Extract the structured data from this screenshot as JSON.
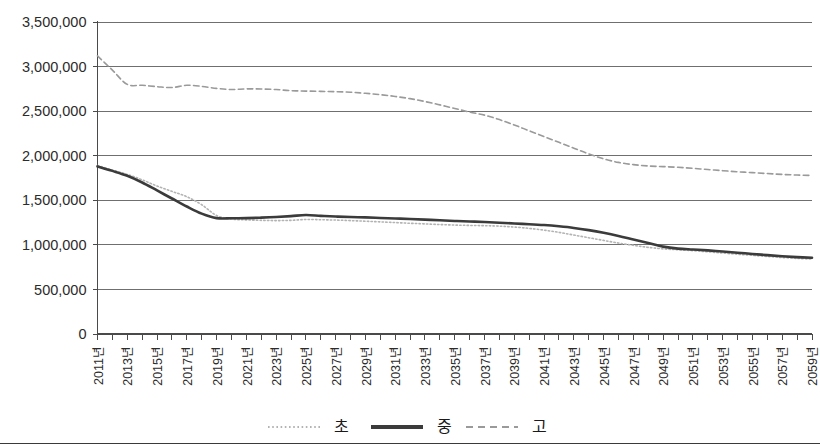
{
  "chart_data": {
    "type": "line",
    "title": "",
    "subtitle": "",
    "xlabel": "",
    "ylabel": "",
    "grid": true,
    "legend_position": "bottom",
    "ylim": [
      0,
      3500000
    ],
    "ytick_labels": [
      "3,500,000",
      "3,000,000",
      "2,500,000",
      "2,000,000",
      "1,500,000",
      "1,000,000",
      "500,000",
      "0"
    ],
    "ytick_values": [
      3500000,
      3000000,
      2500000,
      2000000,
      1500000,
      1000000,
      500000,
      0
    ],
    "xlim": [
      2011,
      2059
    ],
    "x": [
      2011,
      2012,
      2013,
      2014,
      2015,
      2016,
      2017,
      2018,
      2019,
      2020,
      2021,
      2022,
      2023,
      2024,
      2025,
      2026,
      2027,
      2028,
      2029,
      2030,
      2031,
      2032,
      2033,
      2034,
      2035,
      2036,
      2037,
      2038,
      2039,
      2040,
      2041,
      2042,
      2043,
      2044,
      2045,
      2046,
      2047,
      2048,
      2049,
      2050,
      2051,
      2052,
      2053,
      2054,
      2055,
      2056,
      2057,
      2058,
      2059
    ],
    "xtick_labels": [
      "2011년",
      "2013년",
      "2015년",
      "2017년",
      "2019년",
      "2021년",
      "2023년",
      "2025년",
      "2027년",
      "2029년",
      "2031년",
      "2033년",
      "2035년",
      "2037년",
      "2039년",
      "2041년",
      "2043년",
      "2045년",
      "2047년",
      "2049년",
      "2051년",
      "2053년",
      "2055년",
      "2057년",
      "2059년"
    ],
    "xtick_values": [
      2011,
      2013,
      2015,
      2017,
      2019,
      2021,
      2023,
      2025,
      2027,
      2029,
      2031,
      2033,
      2035,
      2037,
      2039,
      2041,
      2043,
      2045,
      2047,
      2049,
      2051,
      2053,
      2055,
      2057,
      2059
    ],
    "series": [
      {
        "name": "초",
        "style": "dotted",
        "color": "#b3b3b3",
        "values": [
          1890000,
          1840000,
          1790000,
          1730000,
          1660000,
          1600000,
          1540000,
          1450000,
          1330000,
          1290000,
          1280000,
          1275000,
          1272000,
          1275000,
          1285000,
          1282000,
          1278000,
          1272000,
          1265000,
          1258000,
          1250000,
          1242000,
          1235000,
          1228000,
          1222000,
          1218000,
          1215000,
          1210000,
          1200000,
          1185000,
          1165000,
          1140000,
          1110000,
          1080000,
          1050000,
          1020000,
          995000,
          972000,
          955000,
          945000,
          935000,
          922000,
          908000,
          895000,
          882000,
          870000,
          858000,
          848000,
          840000
        ]
      },
      {
        "name": "중",
        "style": "solid",
        "color": "#3b3b3b",
        "values": [
          1880000,
          1830000,
          1775000,
          1700000,
          1610000,
          1520000,
          1430000,
          1350000,
          1300000,
          1298000,
          1300000,
          1305000,
          1312000,
          1322000,
          1335000,
          1325000,
          1318000,
          1312000,
          1308000,
          1302000,
          1296000,
          1290000,
          1283000,
          1276000,
          1268000,
          1262000,
          1256000,
          1248000,
          1240000,
          1232000,
          1222000,
          1208000,
          1190000,
          1165000,
          1135000,
          1100000,
          1060000,
          1020000,
          980000,
          958000,
          948000,
          938000,
          925000,
          912000,
          898000,
          885000,
          872000,
          862000,
          855000
        ]
      },
      {
        "name": "고",
        "style": "dashed",
        "color": "#9a9a9a",
        "values": [
          3120000,
          2960000,
          2800000,
          2790000,
          2775000,
          2765000,
          2790000,
          2778000,
          2755000,
          2742000,
          2750000,
          2748000,
          2742000,
          2730000,
          2725000,
          2722000,
          2718000,
          2712000,
          2700000,
          2685000,
          2665000,
          2640000,
          2608000,
          2570000,
          2530000,
          2490000,
          2455000,
          2405000,
          2345000,
          2280000,
          2215000,
          2150000,
          2085000,
          2020000,
          1965000,
          1925000,
          1900000,
          1885000,
          1878000,
          1870000,
          1858000,
          1845000,
          1832000,
          1820000,
          1810000,
          1800000,
          1790000,
          1783000,
          1778000
        ]
      }
    ],
    "legend": [
      {
        "label": "초",
        "style": "dotted",
        "color": "#b3b3b3"
      },
      {
        "label": "중",
        "style": "solid",
        "color": "#3b3b3b"
      },
      {
        "label": "고",
        "style": "dashed",
        "color": "#9a9a9a"
      }
    ]
  }
}
